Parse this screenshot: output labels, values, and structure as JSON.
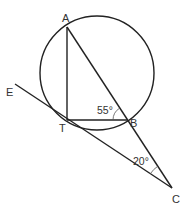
{
  "diagram": {
    "type": "geometry",
    "colors": {
      "stroke": "#222222",
      "label": "#333333",
      "background": "#ffffff"
    },
    "points": {
      "A": {
        "label": "A"
      },
      "T": {
        "label": "T"
      },
      "B": {
        "label": "B"
      },
      "C": {
        "label": "C"
      },
      "E": {
        "label": "E"
      }
    },
    "angles": {
      "angle_ABT": {
        "label": "55°",
        "at": "B"
      },
      "angle_ACT": {
        "label": "20°",
        "at": "C"
      }
    },
    "segments": [
      "AT",
      "TB",
      "AC",
      "EC"
    ]
  }
}
